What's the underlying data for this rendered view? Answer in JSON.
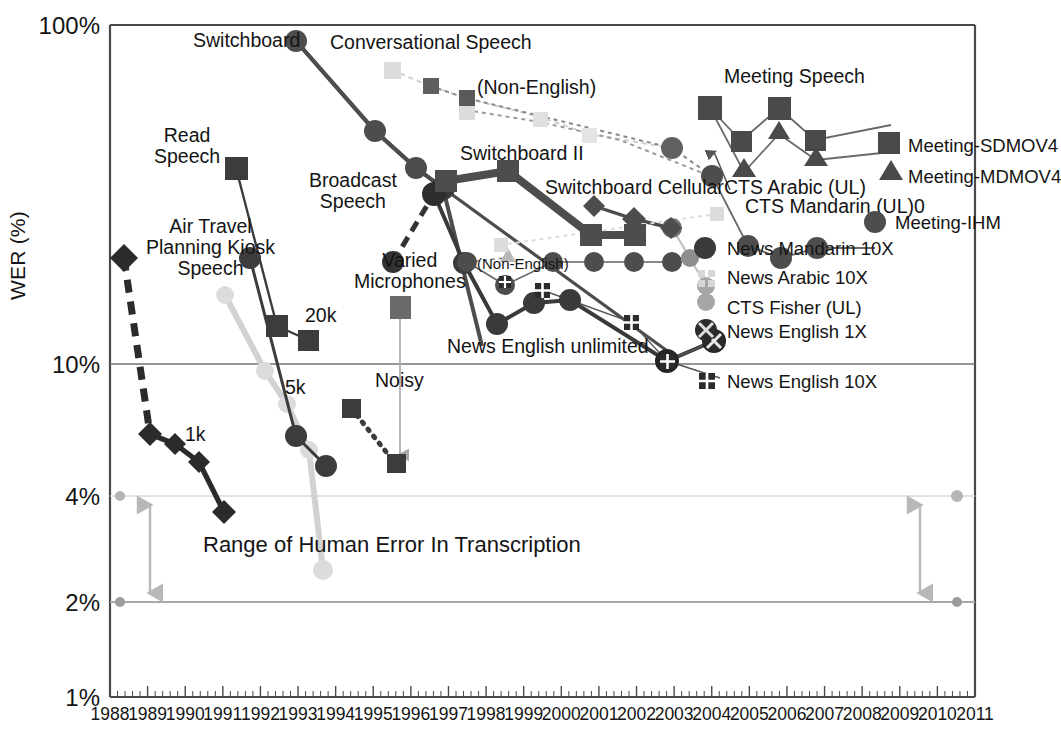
{
  "chart_data": {
    "type": "line",
    "xlabel": "",
    "ylabel": "WER (%)",
    "yscale": "log",
    "ylim": [
      1,
      100
    ],
    "xlim": [
      1988,
      2011
    ],
    "grid": true,
    "legend_position": "right-inside",
    "y_ticks": [
      "100%",
      "10%",
      "4%",
      "2%",
      "1%"
    ],
    "y_tick_values": [
      100,
      10,
      4,
      2,
      1
    ],
    "x_ticks": [
      "1988",
      "1989",
      "1990",
      "1991",
      "1992",
      "1993",
      "1994",
      "1995",
      "1996",
      "1997",
      "1998",
      "1999",
      "2000",
      "2001",
      "2002",
      "2003",
      "2004",
      "2005",
      "2006",
      "2007",
      "2008",
      "2009",
      "2010",
      "2011"
    ],
    "annotations": [
      {
        "text": "Switchboard",
        "x": 1990.9,
        "y": 82
      },
      {
        "text": "Conversational Speech",
        "x": 1993.4,
        "y": 80
      },
      {
        "text": "(Non-English)",
        "x": 1995.6,
        "y": 63
      },
      {
        "text": "Meeting Speech",
        "x": 2004.0,
        "y": 56
      },
      {
        "text": "Read\nSpeech",
        "x": 1989.8,
        "y": 42
      },
      {
        "text": "Switchboard II",
        "x": 1996.9,
        "y": 31
      },
      {
        "text": "Broadcast\nSpeech",
        "x": 1991.7,
        "y": 29
      },
      {
        "text": "Switchboard Cellular",
        "x": 2000.0,
        "y": 25
      },
      {
        "text": "CTS Arabic (UL)",
        "x": 2003.4,
        "y": 21
      },
      {
        "text": "CTS Mandarin (UL)0",
        "x": 2004.0,
        "y": 19.5
      },
      {
        "text": "Air Travel\nPlanning Kiosk\nSpeech",
        "x": 1989.4,
        "y": 21
      },
      {
        "text": "Varied\nMicrophones",
        "x": 1993.3,
        "y": 16
      },
      {
        "text": "(Non-English)",
        "x": 1996.6,
        "y": 14.5
      },
      {
        "text": "20k",
        "x": 1993.1,
        "y": 13
      },
      {
        "text": "5k",
        "x": 1992.9,
        "y": 7.2
      },
      {
        "text": "Noisy",
        "x": 1994.4,
        "y": 7.0
      },
      {
        "text": "1k",
        "x": 1989.6,
        "y": 6.2
      },
      {
        "text": "News English unlimited",
        "x": 1997.6,
        "y": 10.6
      },
      {
        "text": "Range of Human Error In Transcription",
        "x": 1991.0,
        "y": 3.0
      }
    ],
    "series": [
      {
        "name": "Switchboard",
        "marker": "circle",
        "color": "#4d4d4d",
        "linewidth": 3.5,
        "linestyle": "solid",
        "x": [
          1992.05,
          1993.5,
          1994.6,
          1995.85,
          1997.0,
          2000.2
        ],
        "y": [
          96,
          50,
          37,
          30.5,
          28,
          12.5
        ]
      },
      {
        "name": "Conversational Speech (light)",
        "marker": "square",
        "color": "#d9d9d9",
        "linewidth": 1.6,
        "linestyle": "dashed",
        "x": [
          1994.6,
          1995.5,
          1996.2,
          1998.2,
          1999.3,
          2001.1
        ],
        "y": [
          72,
          64,
          54,
          47,
          40,
          32
        ]
      },
      {
        "name": "Conversational Speech (dark)",
        "marker": "square",
        "color": "#6e6e6e",
        "linewidth": 1.6,
        "linestyle": "dashed",
        "x": [
          1995.5,
          1996.2,
          2002.0,
          2002.9
        ],
        "y": [
          64,
          60,
          31,
          25
        ]
      },
      {
        "name": "Switchboard II",
        "marker": "square",
        "color": "#4d4d4d",
        "linewidth": 5.5,
        "linestyle": "solid",
        "x": [
          1996.0,
          1998.0,
          2001.1,
          2002.2
        ],
        "y": [
          29,
          29,
          20.5,
          20.5
        ]
      },
      {
        "name": "Switchboard Cellular",
        "marker": "diamond",
        "color": "#4d4d4d",
        "linewidth": 3.2,
        "linestyle": "solid",
        "x": [
          2001.2,
          2002.0,
          2002.8
        ],
        "y": [
          25.5,
          23.5,
          21.5
        ]
      },
      {
        "name": "Broadcast Speech",
        "marker": "circle",
        "color": "#333333",
        "linewidth": 3.0,
        "linestyle": "dashed",
        "x": [
          1994.9,
          1995.9
        ],
        "y": [
          21,
          28
        ]
      },
      {
        "name": "News English unlimited",
        "marker": "circle",
        "color": "#3a3a3a",
        "linewidth": 3.2,
        "linestyle": "solid",
        "x": [
          1995.9,
          1997.0,
          1998.0,
          1999.1,
          2000.2,
          2002.9,
          2003.9
        ],
        "y": [
          28,
          15.5,
          13.0,
          14.5,
          15.3,
          10.0,
          12.0
        ]
      },
      {
        "name": "News English 10X",
        "marker": "cross-square",
        "color": "#2b2b2b",
        "linewidth": 1.2,
        "linestyle": "solid",
        "x": [
          1998.1,
          2000.2,
          2002.0,
          2002.9
        ],
        "y": [
          16.5,
          15.5,
          13.0,
          10.0
        ]
      },
      {
        "name": "News Mandarin 10X",
        "marker": "circle",
        "color": "#4d4d4d",
        "linewidth": 1.4,
        "linestyle": "solid",
        "x": [
          1997.1,
          1998.1,
          1999.2,
          2000.3,
          2002.9
        ],
        "y": [
          17.0,
          17.5,
          17.0,
          17.0,
          17.0
        ]
      },
      {
        "name": "News Arabic 10X",
        "marker": "fuzzy-square",
        "color": "#cfcfcf",
        "linewidth": 1.2,
        "linestyle": "dashed",
        "x": [
          1998.0,
          2003.2
        ],
        "y": [
          21.5,
          19.5
        ]
      },
      {
        "name": "CTS Fisher (UL)",
        "marker": "circle",
        "color": "#9a9a9a",
        "linewidth": 1.2,
        "linestyle": "solid",
        "x": [
          2003.0,
          2003.9
        ],
        "y": [
          18.5,
          15.5
        ]
      },
      {
        "name": "Meeting-SDMOV4",
        "marker": "square",
        "color": "#4a4a4a",
        "linewidth": 1.4,
        "linestyle": "solid",
        "x": [
          2004.0,
          2004.9,
          2005.9,
          2006.9
        ],
        "y": [
          56,
          46,
          55,
          44
        ]
      },
      {
        "name": "Meeting-MDMOV4",
        "marker": "triangle",
        "color": "#4a4a4a",
        "linewidth": 1.4,
        "linestyle": "solid",
        "x": [
          2004.5,
          2005.9,
          2006.9
        ],
        "y": [
          37,
          44,
          36
        ]
      },
      {
        "name": "Meeting-IHM",
        "marker": "circle",
        "color": "#4d4d4d",
        "linewidth": 1.4,
        "linestyle": "solid",
        "x": [
          2004.4,
          2005.4,
          2006.3
        ],
        "y": [
          19.5,
          17.5,
          19.5
        ]
      },
      {
        "name": "Air Travel Planning Kiosk Speech",
        "marker": "diamond",
        "color": "#2b2b2b",
        "linewidth": 5.0,
        "linestyle": "dashed",
        "x": [
          1988.4,
          1989.2
        ],
        "y": [
          22,
          6.8
        ]
      },
      {
        "name": "1k",
        "marker": "diamond",
        "color": "#2b2b2b",
        "linewidth": 4.2,
        "linestyle": "solid",
        "x": [
          1989.2,
          1989.8,
          1990.4,
          1991.0
        ],
        "y": [
          6.8,
          6.0,
          5.0,
          3.7
        ]
      },
      {
        "name": "20k",
        "marker": "square",
        "color": "#3c3c3c",
        "linewidth": 2.2,
        "linestyle": "solid",
        "x": [
          1991.5,
          1992.6,
          1993.4
        ],
        "y": [
          31,
          14.0,
          12.3
        ]
      },
      {
        "name": "5k",
        "marker": "circle",
        "color": "#3c3c3c",
        "linewidth": 2.4,
        "linestyle": "solid",
        "x": [
          1991.9,
          1993.1,
          1993.9
        ],
        "y": [
          18.5,
          6.6,
          5.0
        ]
      },
      {
        "name": "Read Speech (light)",
        "marker": "circle",
        "color": "#d2d2d2",
        "linewidth": 4.5,
        "linestyle": "solid",
        "x": [
          1991.5,
          1992.6,
          1993.2,
          1993.8,
          1994.2
        ],
        "y": [
          17.0,
          10.0,
          8.0,
          6.0,
          2.6
        ]
      },
      {
        "name": "Noisy",
        "marker": "square",
        "color": "#3c3c3c",
        "linewidth": 3.5,
        "linestyle": "dotted",
        "x": [
          1993.9,
          1995.0
        ],
        "y": [
          6.6,
          4.9
        ]
      },
      {
        "name": "Varied Microphones",
        "marker": "square",
        "color": "#6a6a6a",
        "linewidth": 1.2,
        "linestyle": "solid",
        "x": [
          1994.6
        ],
        "y": [
          14.5
        ]
      },
      {
        "name": "Human error upper",
        "marker": "circle",
        "color": "#b5b5b5",
        "linewidth": 1.6,
        "linestyle": "solid",
        "x": [
          1988.0,
          2011.0
        ],
        "y": [
          4,
          4
        ]
      },
      {
        "name": "Human error lower",
        "marker": "circle",
        "color": "#9c9c9c",
        "linewidth": 1.8,
        "linestyle": "solid",
        "x": [
          1988.0,
          2011.0
        ],
        "y": [
          2,
          2
        ]
      }
    ]
  },
  "axis": {
    "y_label": "WER (%)",
    "y_ticks": [
      "100%",
      "10%",
      "4%",
      "2%",
      "1%"
    ],
    "x_ticks": [
      "1988",
      "1989",
      "1990",
      "1991",
      "1992",
      "1993",
      "1994",
      "1995",
      "1996",
      "1997",
      "1998",
      "1999",
      "2000",
      "2001",
      "2002",
      "2003",
      "2004",
      "2005",
      "2006",
      "2007",
      "2008",
      "2009",
      "2010",
      "2011"
    ]
  },
  "annotations": {
    "switchboard": "Switchboard",
    "conversational_speech": "Conversational Speech",
    "non_english_top": "(Non-English)",
    "meeting_speech": "Meeting Speech",
    "read_speech": "Read\nSpeech",
    "switchboard_ii": "Switchboard II",
    "broadcast_speech": "Broadcast\nSpeech",
    "switchboard_cellular": "Switchboard Cellular",
    "cts_arabic": "CTS Arabic (UL)",
    "cts_mandarin": "CTS Mandarin (UL)0",
    "air_travel": "Air Travel\nPlanning Kiosk\nSpeech",
    "varied_microphones": "Varied\nMicrophones",
    "non_english_mid": "(Non-English)",
    "twenty_k": "20k",
    "five_k": "5k",
    "noisy": "Noisy",
    "one_k": "1k",
    "news_english_unlimited": "News English unlimited",
    "human_range": "Range of Human Error In Transcription"
  },
  "legend": {
    "items": [
      {
        "label": "Meeting-SDMOV4",
        "marker": "square",
        "color": "#4a4a4a"
      },
      {
        "label": "Meeting-MDMOV4",
        "marker": "triangle",
        "color": "#4a4a4a"
      },
      {
        "label": "Meeting-IHM",
        "marker": "circle",
        "color": "#4d4d4d"
      },
      {
        "label": "News Mandarin 10X",
        "marker": "circle",
        "color": "#3a3a3a"
      },
      {
        "label": "News Arabic 10X",
        "marker": "fuzzy-square",
        "color": "#d6d6d6"
      },
      {
        "label": "CTS Fisher (UL)",
        "marker": "circle",
        "color": "#9a9a9a"
      },
      {
        "label": "News English 1X",
        "marker": "cross-circle",
        "color": "#2b2b2b"
      },
      {
        "label": "News English 10X",
        "marker": "cross-square",
        "color": "#2b2b2b"
      }
    ]
  },
  "colors": {
    "axis": "#4a4a4a",
    "grid": "#6e6e6e",
    "human_band": "#b0b0b0",
    "text": "#141414"
  }
}
